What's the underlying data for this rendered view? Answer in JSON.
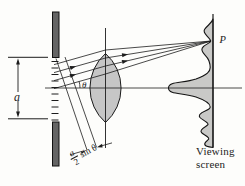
{
  "figure": {
    "slit_width_label": "a",
    "angle_label": "θ",
    "point_label": "P",
    "path_difference": {
      "numerator": "a",
      "denominator": "2",
      "suffix": "sin θ"
    },
    "screen_caption": [
      "Viewing",
      "screen"
    ],
    "colors": {
      "line": "#1c1c1c",
      "barrier_fill": "#646464",
      "lens_fill": "#c6c6c6",
      "pattern_fill": "#c9c9c7",
      "background": "#fdfdfb"
    }
  }
}
